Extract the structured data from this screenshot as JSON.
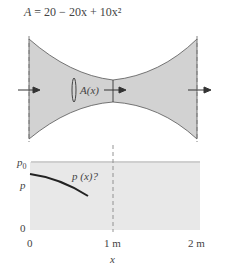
{
  "equation": {
    "lhs": "A",
    "rhs": "= 20 − 20x + 10x²"
  },
  "nozzle": {
    "section_label": "A(x)",
    "fill": "#d4d4d4"
  },
  "plot": {
    "y_labels": {
      "p0": "p",
      "p0_sub": "0",
      "p": "p",
      "zero": "0"
    },
    "x_ticks": [
      "0",
      "1 m",
      "2 m"
    ],
    "x_label": "x",
    "curve_label": "p (x)?",
    "fill": "#e8e8e8"
  }
}
